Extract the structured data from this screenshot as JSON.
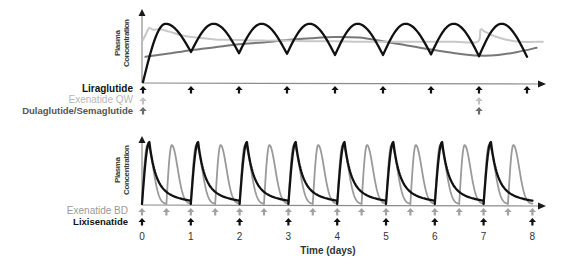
{
  "chart_data": [
    {
      "type": "line",
      "title": "",
      "ylabel": "Plasma Concentration",
      "ylabel_lines": [
        "Plasma",
        "Concentration"
      ],
      "xlabel": "",
      "x_range": [
        0,
        8.35
      ],
      "y_range": [
        0,
        1
      ],
      "grid": false,
      "legend_position": "left, as dose-arrow rows below the x-axis",
      "series": [
        {
          "name": "Liraglutide",
          "color": "#111111",
          "label_color": "#111111",
          "arrow_color": "#111111",
          "dosing": "once daily",
          "dose_days": [
            0,
            1,
            2,
            3,
            4,
            5,
            6,
            7,
            8
          ],
          "model": {
            "kind": "arch",
            "start": 0.0,
            "peak": 0.97,
            "peak_frac": 0.47,
            "troughs": [
              0.5,
              0.48,
              0.47,
              0.45,
              0.45,
              0.46,
              0.43,
              0.42
            ]
          },
          "peak_values": [
            0.97,
            0.97,
            0.97,
            0.97,
            0.97,
            0.98,
            0.98,
            0.98
          ],
          "trough_values": [
            0.5,
            0.48,
            0.47,
            0.45,
            0.45,
            0.46,
            0.43,
            0.42
          ]
        },
        {
          "name": "Exenatide QW",
          "color": "#c8c8c8",
          "label_color": "#b8b8b8",
          "arrow_color": "#c0c0c0",
          "dosing": "once weekly",
          "dose_days": [
            0,
            7
          ],
          "points": [
            [
              0.0,
              0.7
            ],
            [
              0.06,
              0.8
            ],
            [
              0.13,
              0.9
            ],
            [
              0.22,
              0.87
            ],
            [
              0.35,
              0.88
            ],
            [
              0.55,
              0.84
            ],
            [
              0.8,
              0.78
            ],
            [
              1.1,
              0.74
            ],
            [
              1.5,
              0.71
            ],
            [
              2,
              0.7
            ],
            [
              2.5,
              0.69
            ],
            [
              3,
              0.69
            ],
            [
              3.5,
              0.68
            ],
            [
              4,
              0.68
            ],
            [
              4.5,
              0.67
            ],
            [
              5,
              0.67
            ],
            [
              5.5,
              0.67
            ],
            [
              6,
              0.67
            ],
            [
              6.5,
              0.67
            ],
            [
              6.97,
              0.67
            ],
            [
              7.03,
              0.87
            ],
            [
              7.12,
              0.84
            ],
            [
              7.3,
              0.77
            ],
            [
              7.55,
              0.71
            ],
            [
              7.85,
              0.67
            ],
            [
              8.33,
              0.67
            ]
          ]
        },
        {
          "name": "Dulaglutide/Semaglutide",
          "color": "#787878",
          "label_color": "#555555",
          "arrow_color": "#6a6a6a",
          "dosing": "once weekly",
          "dose_days": [
            0,
            7
          ],
          "points": [
            [
              0.05,
              0.42
            ],
            [
              0.5,
              0.47
            ],
            [
              1,
              0.53
            ],
            [
              1.5,
              0.58
            ],
            [
              2,
              0.63
            ],
            [
              2.5,
              0.66
            ],
            [
              3,
              0.7
            ],
            [
              3.5,
              0.73
            ],
            [
              4,
              0.75
            ],
            [
              4.5,
              0.74
            ],
            [
              5,
              0.68
            ],
            [
              5.5,
              0.61
            ],
            [
              6,
              0.54
            ],
            [
              6.5,
              0.48
            ],
            [
              7,
              0.44
            ],
            [
              7.4,
              0.45
            ],
            [
              7.8,
              0.5
            ],
            [
              8.2,
              0.57
            ]
          ]
        }
      ]
    },
    {
      "type": "line",
      "title": "",
      "ylabel": "Plasma Concentration",
      "ylabel_lines": [
        "Plasma",
        "Concentration"
      ],
      "xlabel": "Time (days)",
      "x_ticks": [
        "0",
        "1",
        "2",
        "3",
        "4",
        "5",
        "6",
        "7",
        "8"
      ],
      "x_tick_values": [
        0,
        1,
        2,
        3,
        4,
        5,
        6,
        7,
        8
      ],
      "x_range": [
        0,
        8.2
      ],
      "y_range": [
        0,
        1
      ],
      "grid": false,
      "legend_position": "left, as dose-arrow rows below the x-axis",
      "series": [
        {
          "name": "Exenatide BD",
          "color": "#9a9a9a",
          "label_color": "#9a9a9a",
          "arrow_color": "#a2a2a2",
          "dosing": "twice daily",
          "dose_days": [
            0,
            0.5,
            1,
            1.5,
            2,
            2.5,
            3,
            3.5,
            4,
            4.5,
            5,
            5.5,
            6,
            6.5,
            7,
            7.5,
            8
          ],
          "model": {
            "kind": "pulse_gauss",
            "peak": 0.95,
            "t_peak": 0.11,
            "width": 0.17
          },
          "peak_values": 0.95,
          "trough_values": 0.0
        },
        {
          "name": "Lixisenatide",
          "color": "#111111",
          "label_color": "#111111",
          "arrow_color": "#111111",
          "dosing": "once daily",
          "dose_days": [
            0,
            1,
            2,
            3,
            4,
            5,
            6,
            7,
            8
          ],
          "model": {
            "kind": "pulse_biexp",
            "peak": 1.0,
            "t_peak": 0.15,
            "a": 0.65,
            "tau1": 0.12,
            "tau2": 0.45
          },
          "peak_values": 1.0,
          "trough_values": 0.05
        }
      ]
    }
  ]
}
